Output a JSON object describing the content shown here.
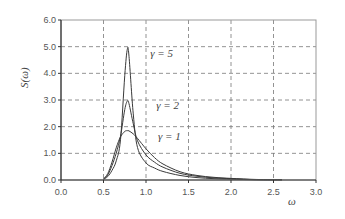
{
  "chart_data": {
    "type": "line",
    "title": "",
    "xlabel": "ω",
    "ylabel": "S(ω)",
    "xlim": [
      0.0,
      3.0
    ],
    "ylim": [
      0.0,
      6.0
    ],
    "xticks": [
      "0.0",
      "0.5",
      "1.0",
      "1.5",
      "2.0",
      "2.5",
      "3.0"
    ],
    "yticks": [
      "0.0",
      "1.0",
      "2.0",
      "3.0",
      "4.0",
      "5.0",
      "6.0"
    ],
    "grid": true,
    "legend_position": "inline annotations",
    "x": [
      0.5,
      0.55,
      0.6,
      0.65,
      0.7,
      0.75,
      0.78,
      0.8,
      0.85,
      0.9,
      1.0,
      1.1,
      1.2,
      1.4,
      1.6,
      1.8,
      2.0,
      2.3,
      2.6
    ],
    "series": [
      {
        "name": "γ = 1",
        "values": [
          0.04,
          0.24,
          0.67,
          1.21,
          1.62,
          1.82,
          1.85,
          1.84,
          1.73,
          1.56,
          1.17,
          0.84,
          0.6,
          0.31,
          0.17,
          0.1,
          0.06,
          0.02,
          0.01
        ]
      },
      {
        "name": "γ = 2",
        "values": [
          0.03,
          0.19,
          0.54,
          1.01,
          1.64,
          2.64,
          2.96,
          2.86,
          2.11,
          1.47,
          0.94,
          0.67,
          0.48,
          0.25,
          0.14,
          0.08,
          0.05,
          0.012,
          0.006
        ]
      },
      {
        "name": "γ = 5",
        "values": [
          0.02,
          0.13,
          0.36,
          0.72,
          1.51,
          3.91,
          4.9,
          4.64,
          2.48,
          1.22,
          0.64,
          0.45,
          0.32,
          0.17,
          0.09,
          0.05,
          0.03,
          0.008,
          0.004
        ]
      }
    ],
    "annotations": [
      {
        "text": "γ = 5",
        "x": 1.05,
        "y": 4.6
      },
      {
        "text": "γ = 2",
        "x": 1.12,
        "y": 2.65
      },
      {
        "text": "γ = 1",
        "x": 1.14,
        "y": 1.5
      }
    ]
  }
}
